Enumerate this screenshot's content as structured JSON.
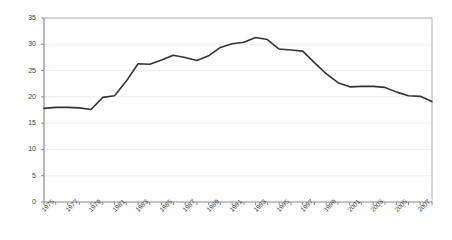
{
  "chart_data": {
    "type": "line",
    "title": "",
    "subtitle": "",
    "xlabel": "",
    "ylabel": "",
    "ylim": [
      0,
      35
    ],
    "ytick_step": 5,
    "yticks": [
      0,
      5,
      10,
      15,
      20,
      25,
      30,
      35
    ],
    "grid": "horizontal",
    "legend": "none",
    "x": [
      1975,
      1976,
      1977,
      1978,
      1979,
      1980,
      1981,
      1982,
      1983,
      1984,
      1985,
      1986,
      1987,
      1988,
      1989,
      1990,
      1991,
      1992,
      1993,
      1994,
      1995,
      1996,
      1997,
      1998,
      1999,
      2000,
      2001,
      2002,
      2003,
      2004,
      2005,
      2006,
      2007,
      2008
    ],
    "values": [
      17.8,
      18.0,
      18.0,
      17.9,
      17.6,
      19.9,
      20.2,
      23.0,
      26.3,
      26.2,
      27.0,
      27.9,
      27.5,
      26.9,
      27.8,
      29.4,
      30.1,
      30.4,
      31.3,
      30.9,
      29.1,
      28.9,
      28.7,
      26.5,
      24.4,
      22.7,
      21.9,
      22.0,
      22.0,
      21.8,
      20.9,
      20.2,
      20.1,
      19.1
    ],
    "xtick_labels": [
      "1975",
      "1977",
      "1979",
      "1981",
      "1983",
      "1985",
      "1987",
      "1989",
      "1991",
      "1993",
      "1995",
      "1997",
      "1999",
      "2001",
      "2003",
      "2005",
      "2007"
    ],
    "xtick_values": [
      1975,
      1977,
      1979,
      1981,
      1983,
      1985,
      1987,
      1989,
      1991,
      1993,
      1995,
      1997,
      1999,
      2001,
      2003,
      2005,
      2007
    ],
    "xlim": [
      1975,
      2008
    ],
    "series_color": "#333333",
    "grid_color": "#ececec",
    "axis_color": "#b0b0b0",
    "background": "#ffffff"
  }
}
